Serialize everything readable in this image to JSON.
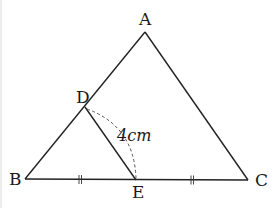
{
  "diagram": {
    "type": "geometry-triangle",
    "points": {
      "A": {
        "label": "A",
        "x": 145,
        "y": 32
      },
      "B": {
        "label": "B",
        "x": 25,
        "y": 179
      },
      "C": {
        "label": "C",
        "x": 248,
        "y": 180
      },
      "D": {
        "label": "D",
        "x": 85,
        "y": 107
      },
      "E": {
        "label": "E",
        "x": 136,
        "y": 180
      }
    },
    "segments": [
      "AB",
      "AC",
      "BC",
      "DE"
    ],
    "measurement": {
      "label": "4cm",
      "segment": "DE",
      "style": "dashed-arc"
    },
    "equal_marks": {
      "segments": [
        "BE",
        "EC"
      ],
      "mark": "double-tick"
    },
    "colors": {
      "stroke": "#222222",
      "dash": "#555555",
      "background": "#ffffff"
    }
  }
}
